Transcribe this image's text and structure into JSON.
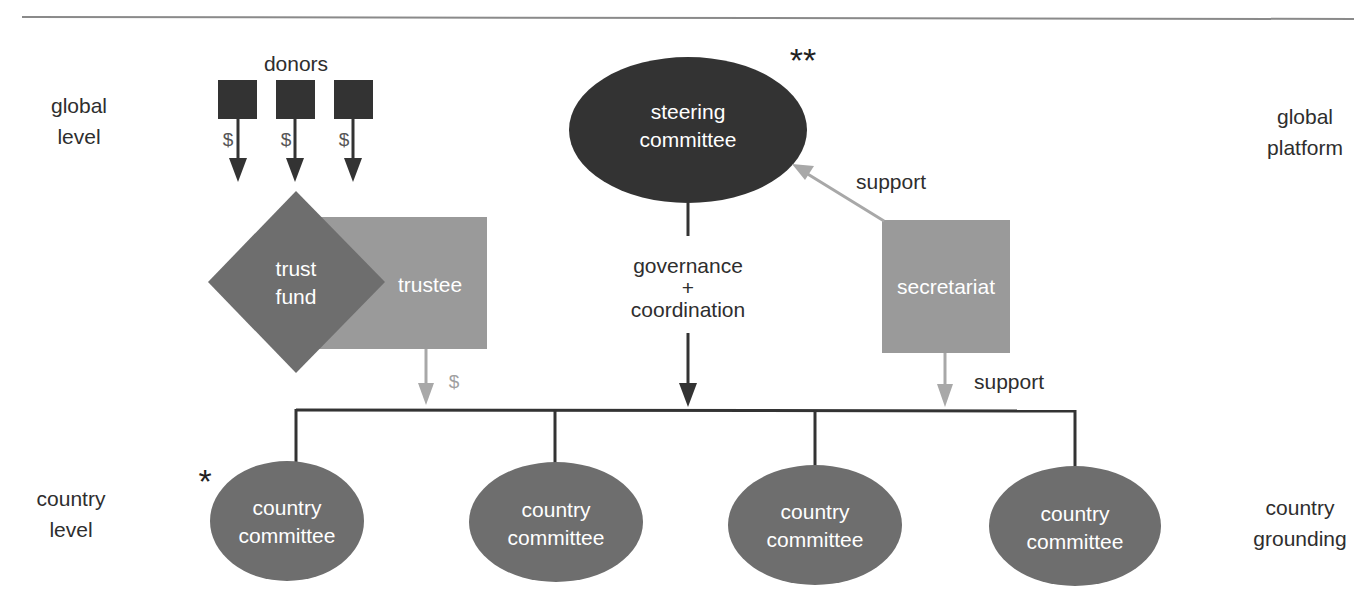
{
  "colors": {
    "dark": "#333333",
    "medium": "#6e6e6e",
    "light": "#9a9a9a",
    "arrow_gray": "#a8a8a8",
    "text": "#2e2e2e",
    "white": "#ffffff"
  },
  "side_labels": {
    "global_level": {
      "line1": "global",
      "line2": "level"
    },
    "country_level": {
      "line1": "country",
      "line2": "level"
    },
    "global_platform": {
      "line1": "global",
      "line2": "platform"
    },
    "country_grounding": {
      "line1": "country",
      "line2": "grounding"
    }
  },
  "donors": {
    "title": "donors",
    "count": 3,
    "flow_symbol": "$"
  },
  "trust_fund": {
    "line1": "trust",
    "line2": "fund"
  },
  "trustee": {
    "label": "trustee",
    "flow_symbol": "$"
  },
  "steering_committee": {
    "line1": "steering",
    "line2": "committee",
    "marker": "**"
  },
  "secretariat": {
    "label": "secretariat",
    "support_up_label": "support",
    "support_down_label": "support"
  },
  "governance": {
    "line1": "governance",
    "line2": "+",
    "line3": "coordination"
  },
  "country_committees": [
    {
      "line1": "country",
      "line2": "committee",
      "marker": "*"
    },
    {
      "line1": "country",
      "line2": "committee"
    },
    {
      "line1": "country",
      "line2": "committee"
    },
    {
      "line1": "country",
      "line2": "committee"
    }
  ]
}
